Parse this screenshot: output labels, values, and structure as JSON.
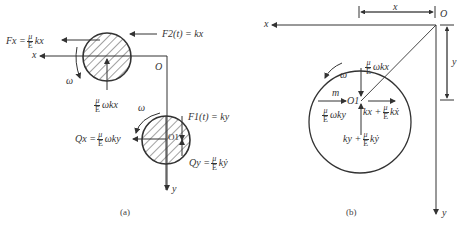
{
  "panel_a": {
    "caption": "(a)",
    "axis_x_label": "x",
    "axis_y_label": "y",
    "origin_label": "O",
    "omega_upper": "ω",
    "omega_lower": "ω",
    "Fx": {
      "lhs": "Fx =",
      "num": "μ",
      "den": "E",
      "rhs": "kx"
    },
    "F2": "F2(t) = kx",
    "F1": "F1(t) = ky",
    "upper_mid": {
      "num": "μ",
      "den": "E",
      "rhs": "ωkx"
    },
    "Qx": {
      "lhs": "Qx =",
      "num": "μ",
      "den": "E",
      "rhs": "ωky"
    },
    "Qy": {
      "lhs": "Qy =",
      "num": "μ",
      "den": "E",
      "rhs": "kẏ"
    },
    "center_label": "O1"
  },
  "panel_b": {
    "caption": "(b)",
    "axis_x_label": "x",
    "axis_y_label": "y",
    "origin_label": "O",
    "dim_x": "x",
    "dim_y": "y",
    "omega": "ω",
    "mass": "m",
    "center_label": "O1",
    "top_force": {
      "num": "μ",
      "den": "E",
      "rhs": "ωkx"
    },
    "left_force": {
      "num": "μ",
      "den": "E",
      "rhs": "ωky"
    },
    "right_force": {
      "lhs": "kx +",
      "num": "μ",
      "den": "E",
      "rhs": "kẋ"
    },
    "bottom_force": {
      "lhs": "ky +",
      "num": "μ",
      "den": "E",
      "rhs": "kẏ"
    }
  },
  "colors": {
    "line": "#333333",
    "hatch": "#444444",
    "background": "#ffffff"
  }
}
